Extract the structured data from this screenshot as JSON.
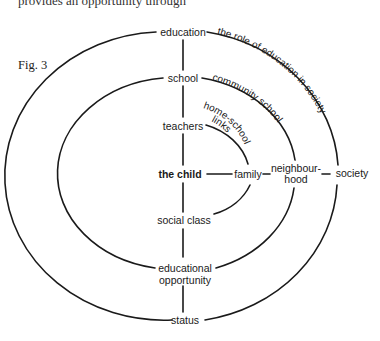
{
  "page": {
    "cut_text": "provides an opportunity through",
    "figure_label": "Fig. 3"
  },
  "diagram": {
    "nodes": {
      "education": "education",
      "school": "school",
      "teachers": "teachers",
      "the_child": "the child",
      "family": "family",
      "neighbourhood_1": "neighbour-",
      "neighbourhood_2": "hood",
      "society": "society",
      "social_class": "social class",
      "educational_opportunity_1": "educational",
      "educational_opportunity_2": "opportunity",
      "status": "status"
    },
    "arc_labels": {
      "outer": "the role of education in society",
      "middle": "community school",
      "inner_1": "home-school",
      "inner_2": "links"
    },
    "line_color": "#1a1a1a"
  }
}
